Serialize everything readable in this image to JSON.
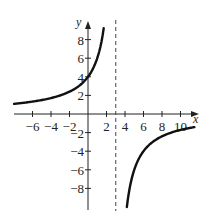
{
  "chart_data": {
    "type": "line",
    "title": "",
    "function": "y = 12/(3 - x)",
    "xlabel": "x",
    "ylabel": "y",
    "xlim": [
      -8,
      11.5
    ],
    "ylim": [
      -10,
      10
    ],
    "x_ticks": [
      -6,
      -4,
      -2,
      2,
      4,
      6,
      8,
      10
    ],
    "x_tick_labels": [
      "−6",
      "−4",
      "−2",
      "2",
      "4",
      "6",
      "8",
      "10"
    ],
    "y_ticks": [
      8,
      6,
      4,
      2,
      -2,
      -4,
      -6,
      -8
    ],
    "y_tick_labels": [
      "8",
      "6",
      "4",
      "2",
      "−2",
      "−4",
      "−6",
      "−8"
    ],
    "vertical_asymptote": 3,
    "horizontal_asymptote": 0,
    "grid": false,
    "legend": null,
    "series": [
      {
        "name": "left branch",
        "x": [
          -8,
          -6,
          -4,
          -2,
          0,
          1,
          1.5,
          1.7
        ],
        "y": [
          1.09,
          1.33,
          1.71,
          2.4,
          4,
          6,
          8,
          9.23
        ]
      },
      {
        "name": "right branch",
        "x": [
          4.2,
          4.5,
          5,
          6,
          7,
          8,
          9,
          10,
          11.5
        ],
        "y": [
          -10,
          -8,
          -6,
          -4,
          -3,
          -2.4,
          -2,
          -1.71,
          -1.41
        ]
      }
    ]
  }
}
